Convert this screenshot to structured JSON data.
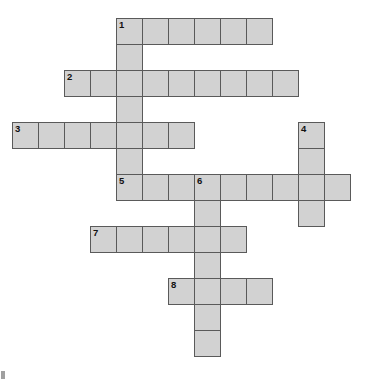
{
  "puzzle": {
    "type": "crossword-grid",
    "title": "Crossword puzzle grid",
    "geometry": {
      "cell_size": 26,
      "origin_x": 12,
      "origin_y": 18,
      "canvas_width": 365,
      "canvas_height": 383
    },
    "colors": {
      "cell_fill": "#d2d2d2",
      "cell_border": "#5a5a5a",
      "number_text": "#111111",
      "background": "#ffffff"
    },
    "entries": [
      {
        "number": "1",
        "direction": "across",
        "row": 0,
        "col": 4,
        "length": 6
      },
      {
        "number": "1",
        "direction": "down",
        "row": 0,
        "col": 4,
        "length": 7
      },
      {
        "number": "2",
        "direction": "across",
        "row": 2,
        "col": 2,
        "length": 9
      },
      {
        "number": "3",
        "direction": "across",
        "row": 4,
        "col": 0,
        "length": 7
      },
      {
        "number": "4",
        "direction": "down",
        "row": 4,
        "col": 11,
        "length": 4
      },
      {
        "number": "5",
        "direction": "across",
        "row": 6,
        "col": 4,
        "length": 9
      },
      {
        "number": "6",
        "direction": "down",
        "row": 6,
        "col": 7,
        "length": 7
      },
      {
        "number": "7",
        "direction": "across",
        "row": 8,
        "col": 3,
        "length": 6
      },
      {
        "number": "8",
        "direction": "across",
        "row": 10,
        "col": 6,
        "length": 4
      }
    ],
    "cells": [
      {
        "row": 0,
        "col": 4,
        "number": "1"
      },
      {
        "row": 0,
        "col": 5,
        "number": ""
      },
      {
        "row": 0,
        "col": 6,
        "number": ""
      },
      {
        "row": 0,
        "col": 7,
        "number": ""
      },
      {
        "row": 0,
        "col": 8,
        "number": ""
      },
      {
        "row": 0,
        "col": 9,
        "number": ""
      },
      {
        "row": 1,
        "col": 4,
        "number": ""
      },
      {
        "row": 2,
        "col": 2,
        "number": "2"
      },
      {
        "row": 2,
        "col": 3,
        "number": ""
      },
      {
        "row": 2,
        "col": 4,
        "number": ""
      },
      {
        "row": 2,
        "col": 5,
        "number": ""
      },
      {
        "row": 2,
        "col": 6,
        "number": ""
      },
      {
        "row": 2,
        "col": 7,
        "number": ""
      },
      {
        "row": 2,
        "col": 8,
        "number": ""
      },
      {
        "row": 2,
        "col": 9,
        "number": ""
      },
      {
        "row": 2,
        "col": 10,
        "number": ""
      },
      {
        "row": 3,
        "col": 4,
        "number": ""
      },
      {
        "row": 4,
        "col": 0,
        "number": "3"
      },
      {
        "row": 4,
        "col": 1,
        "number": ""
      },
      {
        "row": 4,
        "col": 2,
        "number": ""
      },
      {
        "row": 4,
        "col": 3,
        "number": ""
      },
      {
        "row": 4,
        "col": 4,
        "number": ""
      },
      {
        "row": 4,
        "col": 5,
        "number": ""
      },
      {
        "row": 4,
        "col": 6,
        "number": ""
      },
      {
        "row": 4,
        "col": 11,
        "number": "4"
      },
      {
        "row": 5,
        "col": 4,
        "number": ""
      },
      {
        "row": 5,
        "col": 11,
        "number": ""
      },
      {
        "row": 6,
        "col": 4,
        "number": "5"
      },
      {
        "row": 6,
        "col": 5,
        "number": ""
      },
      {
        "row": 6,
        "col": 6,
        "number": ""
      },
      {
        "row": 6,
        "col": 7,
        "number": "6"
      },
      {
        "row": 6,
        "col": 8,
        "number": ""
      },
      {
        "row": 6,
        "col": 9,
        "number": ""
      },
      {
        "row": 6,
        "col": 10,
        "number": ""
      },
      {
        "row": 6,
        "col": 11,
        "number": ""
      },
      {
        "row": 6,
        "col": 12,
        "number": ""
      },
      {
        "row": 7,
        "col": 7,
        "number": ""
      },
      {
        "row": 7,
        "col": 11,
        "number": ""
      },
      {
        "row": 8,
        "col": 3,
        "number": "7"
      },
      {
        "row": 8,
        "col": 4,
        "number": ""
      },
      {
        "row": 8,
        "col": 5,
        "number": ""
      },
      {
        "row": 8,
        "col": 6,
        "number": ""
      },
      {
        "row": 8,
        "col": 7,
        "number": ""
      },
      {
        "row": 8,
        "col": 8,
        "number": ""
      },
      {
        "row": 9,
        "col": 7,
        "number": ""
      },
      {
        "row": 10,
        "col": 6,
        "number": "8"
      },
      {
        "row": 10,
        "col": 7,
        "number": ""
      },
      {
        "row": 10,
        "col": 8,
        "number": ""
      },
      {
        "row": 10,
        "col": 9,
        "number": ""
      },
      {
        "row": 11,
        "col": 7,
        "number": ""
      },
      {
        "row": 12,
        "col": 7,
        "number": ""
      }
    ]
  }
}
